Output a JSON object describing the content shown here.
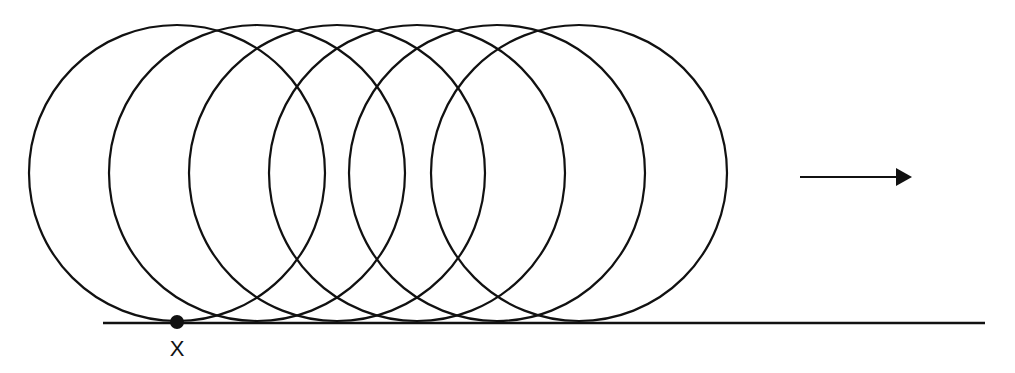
{
  "diagram": {
    "title": "",
    "colors": {
      "stroke": "#111111",
      "background": "#ffffff"
    },
    "ground_line": {
      "x1": 103,
      "x2": 985,
      "y": 323
    },
    "circles": [
      {
        "cx": 177,
        "cy": 173,
        "r": 148
      },
      {
        "cx": 257,
        "cy": 173,
        "r": 148
      },
      {
        "cx": 337,
        "cy": 173,
        "r": 148
      },
      {
        "cx": 417,
        "cy": 173,
        "r": 148
      },
      {
        "cx": 497,
        "cy": 173,
        "r": 148
      },
      {
        "cx": 579,
        "cy": 173,
        "r": 148
      }
    ],
    "point": {
      "cx": 177,
      "cy": 322,
      "r": 7,
      "label": "X",
      "label_x": 177,
      "label_y": 349
    },
    "arrow": {
      "x1": 800,
      "x2": 912,
      "y": 177,
      "direction": "right"
    }
  }
}
